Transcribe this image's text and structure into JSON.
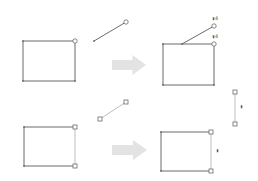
{
  "diagram": {
    "title": "",
    "colors": {
      "background": "#ffffff",
      "stroke": "#6b6b6b",
      "stroke_light": "#bdbdbd",
      "handle_fill": "#ffffff",
      "arrow": "#e3e3e3"
    },
    "panels": [
      {
        "name": "top-before",
        "rect": {
          "x": 23,
          "y": 41,
          "w": 52,
          "h": 40,
          "handle": "circle",
          "handle_corners": [
            "top-right"
          ]
        },
        "line": {
          "x1": 94,
          "y1": 41,
          "x2": 126,
          "y2": 22,
          "start_handle": "dot",
          "end_handle": "circle"
        }
      },
      {
        "name": "top-after",
        "rect": {
          "x": 163,
          "y": 44,
          "w": 51,
          "h": 41,
          "handle": "circle",
          "handle_corners": [
            "top-right"
          ]
        },
        "line": {
          "x1": 182,
          "y1": 44,
          "x2": 214,
          "y2": 26,
          "start_handle": "dot",
          "end_handle": "circle"
        },
        "glue_markers": [
          {
            "x": 212,
            "y": 20,
            "label": "▮4"
          },
          {
            "x": 212,
            "y": 38,
            "label": "▮4"
          }
        ]
      },
      {
        "name": "bottom-before",
        "rect": {
          "x": 24,
          "y": 127,
          "w": 51,
          "h": 39,
          "handle": "square",
          "handle_corners": [
            "top-right",
            "bottom-right"
          ]
        },
        "line": {
          "x1": 100,
          "y1": 119,
          "x2": 126,
          "y2": 102,
          "start_handle": "square",
          "end_handle": "square"
        }
      },
      {
        "name": "bottom-after",
        "rect": {
          "x": 161,
          "y": 132,
          "w": 50,
          "h": 39,
          "handle": "square",
          "handle_corners": [
            "top-right",
            "bottom-right"
          ]
        },
        "line": {
          "x1": 235,
          "y1": 92,
          "x2": 235,
          "y2": 124,
          "start_handle": "square",
          "end_handle": "square"
        },
        "glue_markers": [
          {
            "x": 216,
            "y": 152,
            "label": "▮"
          },
          {
            "x": 240,
            "y": 108,
            "label": "▮"
          }
        ]
      }
    ],
    "arrows": [
      {
        "name": "top-arrow",
        "x": 112,
        "y": 55,
        "w": 34,
        "h": 20
      },
      {
        "name": "bottom-arrow",
        "x": 112,
        "y": 140,
        "w": 35,
        "h": 20
      }
    ]
  }
}
